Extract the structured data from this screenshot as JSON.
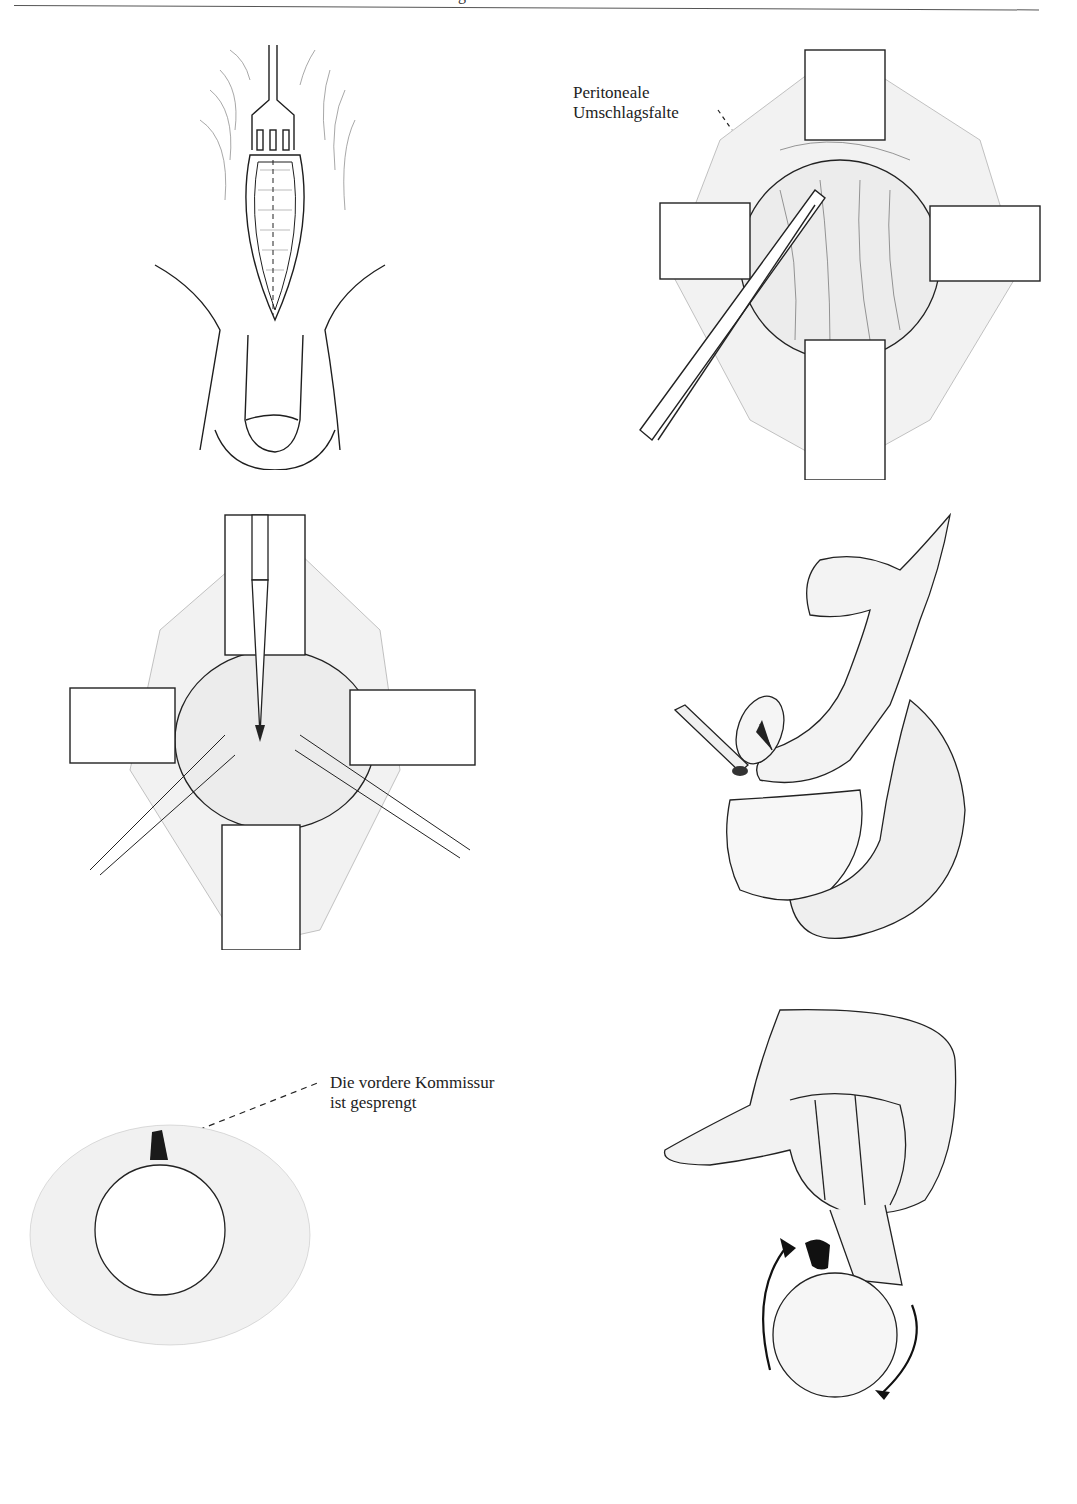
{
  "page": {
    "header_fragment": "g",
    "figures": [
      {
        "id": "fig-1",
        "description": "Incision with retractor fork, midline dashed line"
      },
      {
        "id": "fig-2",
        "description": "Four retractors exposing bladder, forceps lifting peritoneal fold",
        "label": {
          "line1": "Peritoneale",
          "line2": "Umschlagsfalte"
        }
      },
      {
        "id": "fig-3",
        "description": "Four retractors, knife incising, two traction sutures"
      },
      {
        "id": "fig-4",
        "description": "Sagittal view with finger, catheter and arrow"
      },
      {
        "id": "fig-5",
        "description": "Circular opening with dark commissure",
        "label": {
          "line1": "Die vordere Kommissur",
          "line2": "ist gesprengt"
        }
      },
      {
        "id": "fig-6",
        "description": "Hand with finger inserted, circular arrows showing rotation"
      }
    ]
  }
}
